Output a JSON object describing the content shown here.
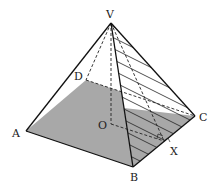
{
  "diagram": {
    "labels": {
      "V": "V",
      "A": "A",
      "B": "B",
      "C": "C",
      "D": "D",
      "O": "O",
      "X": "X"
    },
    "colors": {
      "base_fill": "#a8a8a8",
      "edge": "#111111",
      "hatch": "#222222",
      "background": "#ffffff"
    }
  }
}
